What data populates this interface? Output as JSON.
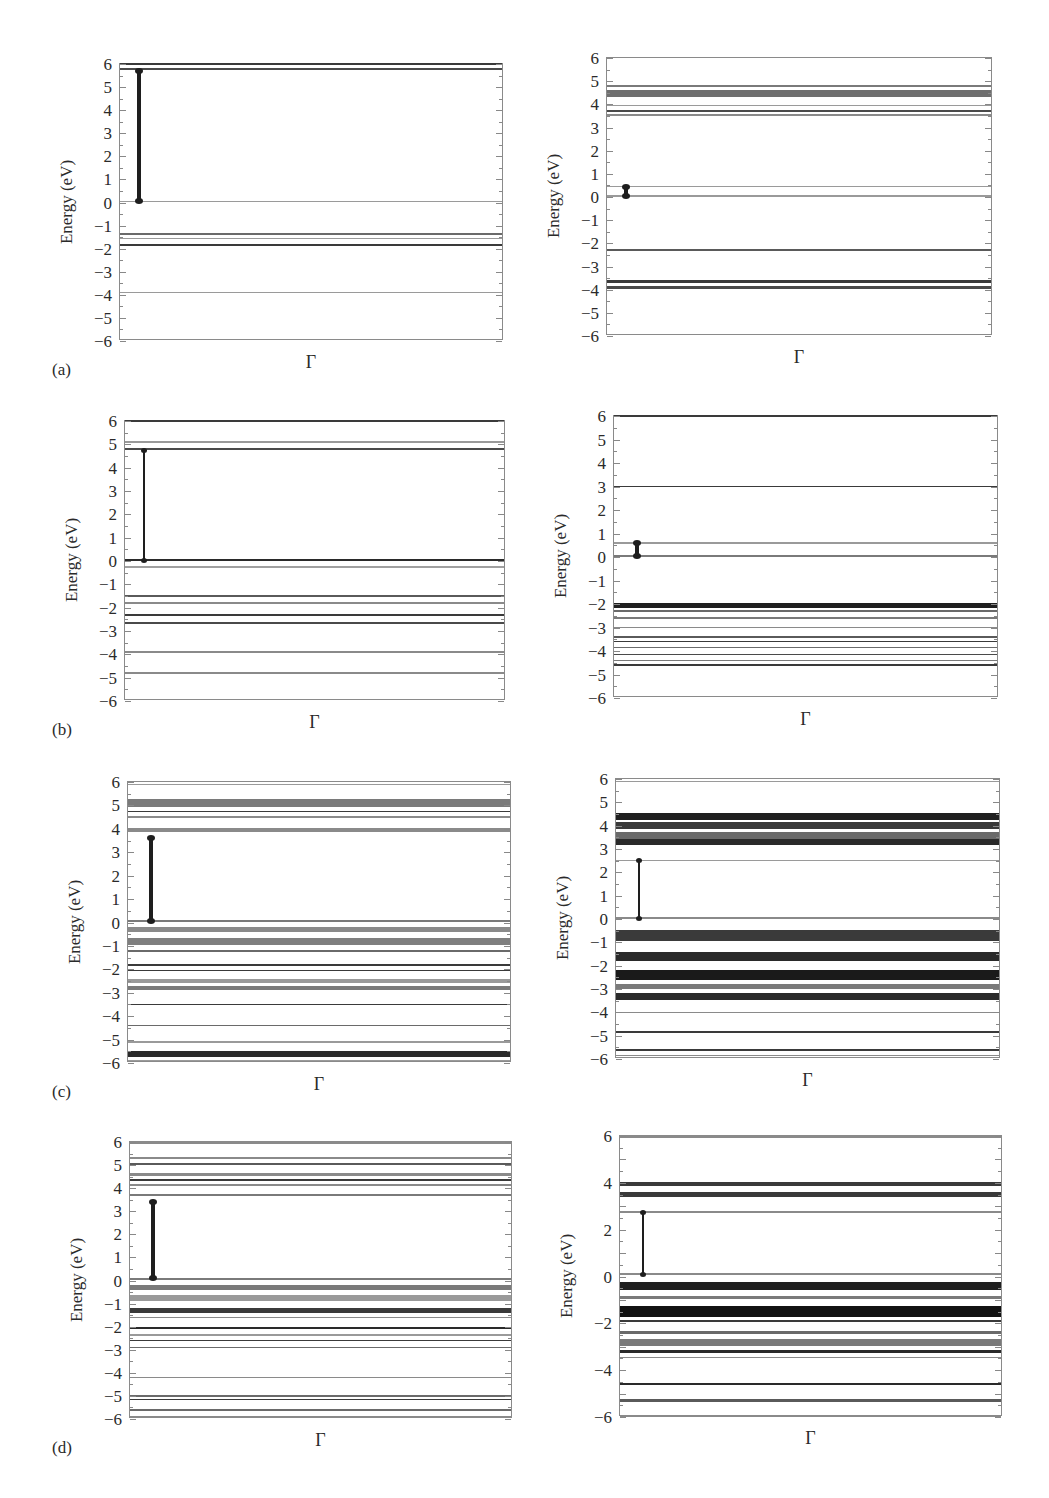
{
  "figure": {
    "y_axis_label": "Energy (eV)",
    "x_axis_label": "Γ",
    "panel_labels": [
      "(a)",
      "(b)",
      "(c)",
      "(d)"
    ]
  },
  "chart_data": [
    {
      "type": "line",
      "id": "a-left",
      "row_label": "(a)",
      "title": "",
      "xlabel": "Γ",
      "ylabel": "Energy (eV)",
      "ylim": [
        -6,
        6
      ],
      "yticks": [
        6,
        5,
        4,
        3,
        2,
        1,
        0,
        -1,
        -2,
        -3,
        -4,
        -5,
        -6
      ],
      "grid": false,
      "bands": [
        {
          "y": 6.0,
          "w": 0.12,
          "shade": "#3a3a3a"
        },
        {
          "y": 5.78,
          "w": 0.08,
          "shade": "#4a4a4a"
        },
        {
          "y": 0.05,
          "w": 0.05,
          "shade": "#9a9a9a"
        },
        {
          "y": -1.35,
          "w": 0.08,
          "shade": "#6a6a6a"
        },
        {
          "y": -1.55,
          "w": 0.05,
          "shade": "#9a9a9a"
        },
        {
          "y": -1.85,
          "w": 0.1,
          "shade": "#3a3a3a"
        },
        {
          "y": -3.9,
          "w": 0.05,
          "shade": "#9a9a9a"
        }
      ],
      "gap_arrow": {
        "from": 0.05,
        "to": 5.7,
        "x_frac": 0.05,
        "thin": false
      }
    },
    {
      "type": "line",
      "id": "a-right",
      "row_label": "(a)",
      "title": "",
      "xlabel": "Γ",
      "ylabel": "Energy (eV)",
      "ylim": [
        -6,
        6
      ],
      "yticks": [
        6,
        5,
        4,
        3,
        2,
        1,
        0,
        -1,
        -2,
        -3,
        -4,
        -5,
        -6
      ],
      "grid": false,
      "bands": [
        {
          "y": 4.8,
          "w": 0.06,
          "shade": "#7a7a7a"
        },
        {
          "y": 4.45,
          "w": 0.3,
          "shade": "#6f6f6f"
        },
        {
          "y": 3.95,
          "w": 0.04,
          "shade": "#9a9a9a"
        },
        {
          "y": 3.7,
          "w": 0.08,
          "shade": "#4a4a4a"
        },
        {
          "y": 3.55,
          "w": 0.05,
          "shade": "#8a8a8a"
        },
        {
          "y": 0.45,
          "w": 0.04,
          "shade": "#9a9a9a"
        },
        {
          "y": 0.05,
          "w": 0.04,
          "shade": "#9a9a9a"
        },
        {
          "y": -2.3,
          "w": 0.08,
          "shade": "#5a5a5a"
        },
        {
          "y": -3.65,
          "w": 0.1,
          "shade": "#3a3a3a"
        },
        {
          "y": -3.9,
          "w": 0.1,
          "shade": "#4a4a4a"
        }
      ],
      "gap_arrow": {
        "from": 0.05,
        "to": 0.45,
        "x_frac": 0.05,
        "thin": false
      }
    },
    {
      "type": "line",
      "id": "b-left",
      "row_label": "(b)",
      "title": "",
      "xlabel": "Γ",
      "ylabel": "Energy (eV)",
      "ylim": [
        -6,
        6
      ],
      "yticks": [
        6,
        5,
        4,
        3,
        2,
        1,
        0,
        -1,
        -2,
        -3,
        -4,
        -5,
        -6
      ],
      "grid": false,
      "bands": [
        {
          "y": 6.0,
          "w": 0.08,
          "shade": "#3a3a3a"
        },
        {
          "y": 5.1,
          "w": 0.04,
          "shade": "#9a9a9a"
        },
        {
          "y": 4.8,
          "w": 0.1,
          "shade": "#4a4a4a"
        },
        {
          "y": 0.05,
          "w": 0.1,
          "shade": "#2a2a2a"
        },
        {
          "y": -0.25,
          "w": 0.04,
          "shade": "#a0a0a0"
        },
        {
          "y": -1.5,
          "w": 0.08,
          "shade": "#5a5a5a"
        },
        {
          "y": -1.8,
          "w": 0.05,
          "shade": "#8a8a8a"
        },
        {
          "y": -2.3,
          "w": 0.08,
          "shade": "#3a3a3a"
        },
        {
          "y": -2.65,
          "w": 0.08,
          "shade": "#4a4a4a"
        },
        {
          "y": -3.9,
          "w": 0.05,
          "shade": "#8a8a8a"
        },
        {
          "y": -4.8,
          "w": 0.05,
          "shade": "#8a8a8a"
        }
      ],
      "gap_arrow": {
        "from": 0.05,
        "to": 4.7,
        "x_frac": 0.05,
        "thin": true
      }
    },
    {
      "type": "line",
      "id": "b-right",
      "row_label": "(b)",
      "title": "",
      "xlabel": "Γ",
      "ylabel": "Energy (eV)",
      "ylim": [
        -6,
        6
      ],
      "yticks": [
        6,
        5,
        4,
        3,
        2,
        1,
        0,
        -1,
        -2,
        -3,
        -4,
        -5,
        -6
      ],
      "grid": false,
      "bands": [
        {
          "y": 6.0,
          "w": 0.06,
          "shade": "#3a3a3a"
        },
        {
          "y": 3.0,
          "w": 0.08,
          "shade": "#3a3a3a"
        },
        {
          "y": 0.6,
          "w": 0.04,
          "shade": "#9a9a9a"
        },
        {
          "y": 0.05,
          "w": 0.06,
          "shade": "#7a7a7a"
        },
        {
          "y": -2.05,
          "w": 0.2,
          "shade": "#1f1f1f"
        },
        {
          "y": -2.3,
          "w": 0.05,
          "shade": "#6a6a6a"
        },
        {
          "y": -2.6,
          "w": 0.1,
          "shade": "#7a7a7a"
        },
        {
          "y": -3.0,
          "w": 0.05,
          "shade": "#8a8a8a"
        },
        {
          "y": -3.4,
          "w": 0.1,
          "shade": "#5a5a5a"
        },
        {
          "y": -3.6,
          "w": 0.05,
          "shade": "#3a3a3a"
        },
        {
          "y": -3.85,
          "w": 0.08,
          "shade": "#6a6a6a"
        },
        {
          "y": -4.15,
          "w": 0.08,
          "shade": "#4a4a4a"
        },
        {
          "y": -4.4,
          "w": 0.05,
          "shade": "#7a7a7a"
        },
        {
          "y": -4.6,
          "w": 0.08,
          "shade": "#3a3a3a"
        }
      ],
      "gap_arrow": {
        "from": 0.05,
        "to": 0.6,
        "x_frac": 0.06,
        "thin": false
      }
    },
    {
      "type": "line",
      "id": "c-left",
      "row_label": "(c)",
      "title": "",
      "xlabel": "Γ",
      "ylabel": "Energy (eV)",
      "ylim": [
        -6,
        6
      ],
      "yticks": [
        6,
        5,
        4,
        3,
        2,
        1,
        0,
        -1,
        -2,
        -3,
        -4,
        -5,
        -6
      ],
      "grid": false,
      "bands": [
        {
          "y": 5.9,
          "w": 0.04,
          "shade": "#9a9a9a"
        },
        {
          "y": 5.1,
          "w": 0.35,
          "shade": "#7a7a7a"
        },
        {
          "y": 4.75,
          "w": 0.06,
          "shade": "#3a3a3a"
        },
        {
          "y": 4.5,
          "w": 0.05,
          "shade": "#8a8a8a"
        },
        {
          "y": 3.95,
          "w": 0.2,
          "shade": "#8a8a8a"
        },
        {
          "y": 0.05,
          "w": 0.1,
          "shade": "#7a7a7a"
        },
        {
          "y": -0.3,
          "w": 0.2,
          "shade": "#8a8a8a"
        },
        {
          "y": -0.8,
          "w": 0.3,
          "shade": "#7f7f7f"
        },
        {
          "y": -1.2,
          "w": 0.08,
          "shade": "#6a6a6a"
        },
        {
          "y": -1.8,
          "w": 0.08,
          "shade": "#3a3a3a"
        },
        {
          "y": -2.05,
          "w": 0.08,
          "shade": "#3a3a3a"
        },
        {
          "y": -2.5,
          "w": 0.2,
          "shade": "#9a9a9a"
        },
        {
          "y": -2.8,
          "w": 0.2,
          "shade": "#7a7a7a"
        },
        {
          "y": -3.5,
          "w": 0.06,
          "shade": "#3a3a3a"
        },
        {
          "y": -4.4,
          "w": 0.08,
          "shade": "#6a6a6a"
        },
        {
          "y": -5.1,
          "w": 0.04,
          "shade": "#9a9a9a"
        },
        {
          "y": -5.6,
          "w": 0.25,
          "shade": "#2a2a2a"
        },
        {
          "y": -5.9,
          "w": 0.05,
          "shade": "#9a9a9a"
        }
      ],
      "gap_arrow": {
        "from": 0.05,
        "to": 3.6,
        "x_frac": 0.06,
        "thin": false
      }
    },
    {
      "type": "line",
      "id": "c-right",
      "row_label": "(c)",
      "title": "",
      "xlabel": "Γ",
      "ylabel": "Energy (eV)",
      "ylim": [
        -6,
        6
      ],
      "yticks": [
        6,
        5,
        4,
        3,
        2,
        1,
        0,
        -1,
        -2,
        -3,
        -4,
        -5,
        -6
      ],
      "grid": false,
      "bands": [
        {
          "y": 5.9,
          "w": 0.04,
          "shade": "#9a9a9a"
        },
        {
          "y": 4.4,
          "w": 0.3,
          "shade": "#1f1f1f"
        },
        {
          "y": 4.0,
          "w": 0.3,
          "shade": "#3a3a3a"
        },
        {
          "y": 3.6,
          "w": 0.3,
          "shade": "#6a6a6a"
        },
        {
          "y": 3.3,
          "w": 0.25,
          "shade": "#2a2a2a"
        },
        {
          "y": 2.5,
          "w": 0.05,
          "shade": "#9a9a9a"
        },
        {
          "y": 0.05,
          "w": 0.05,
          "shade": "#8a8a8a"
        },
        {
          "y": -0.7,
          "w": 0.5,
          "shade": "#3a3a3a"
        },
        {
          "y": -1.6,
          "w": 0.4,
          "shade": "#2a2a2a"
        },
        {
          "y": -2.4,
          "w": 0.45,
          "shade": "#1a1a1a"
        },
        {
          "y": -2.9,
          "w": 0.2,
          "shade": "#7a7a7a"
        },
        {
          "y": -3.3,
          "w": 0.3,
          "shade": "#2a2a2a"
        },
        {
          "y": -4.0,
          "w": 0.05,
          "shade": "#8a8a8a"
        },
        {
          "y": -4.85,
          "w": 0.08,
          "shade": "#3a3a3a"
        },
        {
          "y": -5.6,
          "w": 0.1,
          "shade": "#3a3a3a"
        },
        {
          "y": -5.85,
          "w": 0.04,
          "shade": "#8a8a8a"
        }
      ],
      "gap_arrow": {
        "from": 0.05,
        "to": 2.5,
        "x_frac": 0.06,
        "thin": true
      }
    },
    {
      "type": "line",
      "id": "d-left",
      "row_label": "(d)",
      "title": "",
      "xlabel": "Γ",
      "ylabel": "Energy (eV)",
      "ylim": [
        -6,
        6
      ],
      "yticks": [
        6,
        5,
        4,
        3,
        2,
        1,
        0,
        -1,
        -2,
        -3,
        -4,
        -5,
        -6
      ],
      "grid": false,
      "bands": [
        {
          "y": 5.95,
          "w": 0.06,
          "shade": "#8a8a8a"
        },
        {
          "y": 5.3,
          "w": 0.06,
          "shade": "#8a8a8a"
        },
        {
          "y": 5.05,
          "w": 0.08,
          "shade": "#5a5a5a"
        },
        {
          "y": 4.6,
          "w": 0.15,
          "shade": "#8a8a8a"
        },
        {
          "y": 4.35,
          "w": 0.1,
          "shade": "#3a3a3a"
        },
        {
          "y": 4.15,
          "w": 0.1,
          "shade": "#8a8a8a"
        },
        {
          "y": 3.7,
          "w": 0.1,
          "shade": "#7a7a7a"
        },
        {
          "y": 0.05,
          "w": 0.1,
          "shade": "#7a7a7a"
        },
        {
          "y": -0.3,
          "w": 0.2,
          "shade": "#7a7a7a"
        },
        {
          "y": -0.75,
          "w": 0.25,
          "shade": "#9a9a9a"
        },
        {
          "y": -1.3,
          "w": 0.2,
          "shade": "#3a3a3a"
        },
        {
          "y": -1.6,
          "w": 0.08,
          "shade": "#8a8a8a"
        },
        {
          "y": -2.05,
          "w": 0.06,
          "shade": "#2a2a2a"
        },
        {
          "y": -2.35,
          "w": 0.1,
          "shade": "#9a9a9a"
        },
        {
          "y": -2.6,
          "w": 0.08,
          "shade": "#3a3a3a"
        },
        {
          "y": -2.9,
          "w": 0.08,
          "shade": "#6a6a6a"
        },
        {
          "y": -4.2,
          "w": 0.05,
          "shade": "#8a8a8a"
        },
        {
          "y": -5.0,
          "w": 0.08,
          "shade": "#6a6a6a"
        },
        {
          "y": -5.15,
          "w": 0.05,
          "shade": "#3a3a3a"
        },
        {
          "y": -5.6,
          "w": 0.1,
          "shade": "#6a6a6a"
        },
        {
          "y": -5.9,
          "w": 0.06,
          "shade": "#8a8a8a"
        }
      ],
      "gap_arrow": {
        "from": 0.1,
        "to": 3.4,
        "x_frac": 0.06,
        "thin": false
      }
    },
    {
      "type": "line",
      "id": "d-right",
      "row_label": "(d)",
      "title": "",
      "xlabel": "Γ",
      "ylabel": "Energy (eV)",
      "ylim": [
        -6,
        6
      ],
      "yticks": [
        6,
        4,
        2,
        0,
        -2,
        -4,
        -6
      ],
      "grid": false,
      "bands": [
        {
          "y": 5.95,
          "w": 0.05,
          "shade": "#8a8a8a"
        },
        {
          "y": 3.95,
          "w": 0.15,
          "shade": "#3a3a3a"
        },
        {
          "y": 3.5,
          "w": 0.25,
          "shade": "#3a3a3a"
        },
        {
          "y": 2.75,
          "w": 0.05,
          "shade": "#8a8a8a"
        },
        {
          "y": 0.1,
          "w": 0.06,
          "shade": "#8a8a8a"
        },
        {
          "y": -0.4,
          "w": 0.35,
          "shade": "#1f1f1f"
        },
        {
          "y": -0.9,
          "w": 0.15,
          "shade": "#7a7a7a"
        },
        {
          "y": -1.5,
          "w": 0.5,
          "shade": "#121212"
        },
        {
          "y": -1.9,
          "w": 0.08,
          "shade": "#3a3a3a"
        },
        {
          "y": -2.4,
          "w": 0.15,
          "shade": "#6a6a6a"
        },
        {
          "y": -2.8,
          "w": 0.3,
          "shade": "#7a7a7a"
        },
        {
          "y": -3.2,
          "w": 0.1,
          "shade": "#2a2a2a"
        },
        {
          "y": -3.45,
          "w": 0.05,
          "shade": "#8a8a8a"
        },
        {
          "y": -4.6,
          "w": 0.06,
          "shade": "#2a2a2a"
        },
        {
          "y": -5.3,
          "w": 0.15,
          "shade": "#5a5a5a"
        },
        {
          "y": -5.95,
          "w": 0.05,
          "shade": "#8a8a8a"
        }
      ],
      "gap_arrow": {
        "from": 0.1,
        "to": 2.7,
        "x_frac": 0.06,
        "thin": true
      }
    }
  ]
}
